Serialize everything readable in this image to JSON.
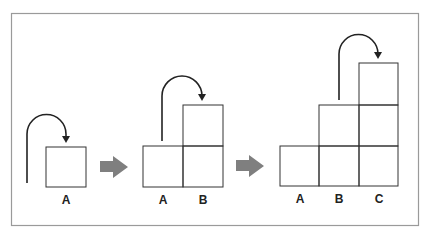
{
  "diagram": {
    "colors": {
      "frame": "#9a9a9a",
      "box_stroke": "#333333",
      "curve": "#222222",
      "step_arrow": "#7f7f7f",
      "background": "#ffffff"
    },
    "panels": [
      {
        "columns": [
          {
            "label": "A",
            "height": 1
          }
        ],
        "move": {
          "from": "A",
          "to": "A"
        }
      },
      {
        "columns": [
          {
            "label": "A",
            "height": 1
          },
          {
            "label": "B",
            "height": 2
          }
        ],
        "move": {
          "from": "A",
          "to": "B"
        }
      },
      {
        "columns": [
          {
            "label": "A",
            "height": 1
          },
          {
            "label": "B",
            "height": 2
          },
          {
            "label": "C",
            "height": 3
          }
        ],
        "move": {
          "from": "B",
          "to": "C"
        }
      }
    ],
    "labels": {
      "p1_a": "A",
      "p2_a": "A",
      "p2_b": "B",
      "p3_a": "A",
      "p3_b": "B",
      "p3_c": "C"
    }
  }
}
